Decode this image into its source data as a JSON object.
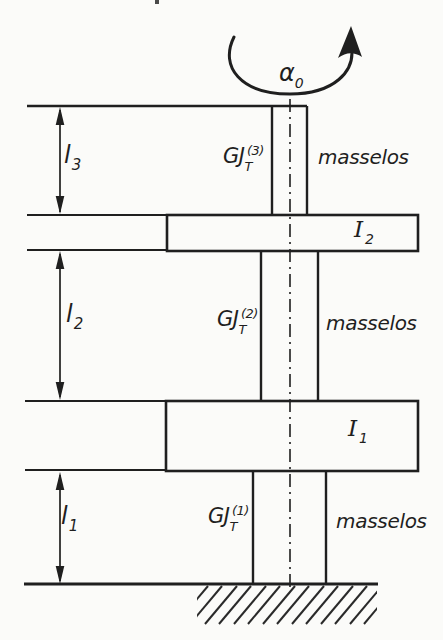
{
  "figure": {
    "type": "torsional-vibration-stepped-shaft-diagram",
    "colors": {
      "ink": "#1f1f1f",
      "paper": "#fbfbf9"
    },
    "rotation": {
      "base": "α",
      "sub": "0"
    },
    "segments": [
      {
        "length": {
          "base": "l",
          "sub": "3"
        },
        "stiffness": {
          "base": "GJ",
          "sub": "T",
          "sup": "(3)"
        },
        "note": "masselos"
      },
      {
        "length": {
          "base": "l",
          "sub": "2"
        },
        "stiffness": {
          "base": "GJ",
          "sub": "T",
          "sup": "(2)"
        },
        "note": "masselos"
      },
      {
        "length": {
          "base": "l",
          "sub": "1"
        },
        "stiffness": {
          "base": "GJ",
          "sub": "T",
          "sup": "(1)"
        },
        "note": "masselos"
      }
    ],
    "disks": [
      {
        "label": {
          "base": "I",
          "sub": "2"
        }
      },
      {
        "label": {
          "base": "I",
          "sub": "1"
        }
      }
    ]
  }
}
